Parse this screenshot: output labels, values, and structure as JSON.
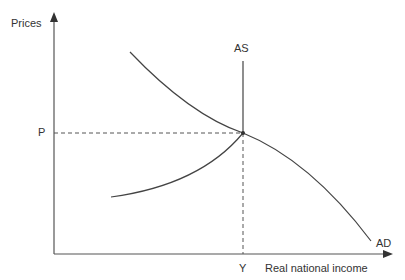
{
  "diagram": {
    "type": "aggregate-demand-supply",
    "y_axis_label": "Prices",
    "x_axis_label": "Real national income",
    "price_marker": "P",
    "income_marker": "Y",
    "curves": [
      {
        "name": "AS",
        "label": "AS"
      },
      {
        "name": "AD",
        "label": "AD"
      }
    ],
    "equilibrium": {
      "price": "P",
      "income": "Y"
    },
    "colors": {
      "line": "#444444",
      "text": "#333333"
    }
  }
}
